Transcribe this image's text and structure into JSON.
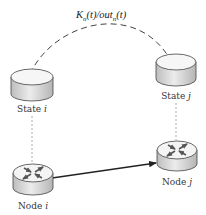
{
  "diagram": {
    "edge_label": {
      "k": "K",
      "k_sub": "n",
      "k_arg": "(t)/",
      "out": "out",
      "out_sub": "n",
      "out_arg": "(t)"
    },
    "nodes": [
      {
        "id": "state_i",
        "kind": "database-cylinder",
        "label_text": "State ",
        "label_var": "i"
      },
      {
        "id": "state_j",
        "kind": "database-cylinder",
        "label_text": "State ",
        "label_var": "j"
      },
      {
        "id": "node_i",
        "kind": "router",
        "label_text": "Node ",
        "label_var": "i"
      },
      {
        "id": "node_j",
        "kind": "router",
        "label_text": "Node ",
        "label_var": "j"
      }
    ],
    "edges": [
      {
        "from": "state_i",
        "to": "state_j",
        "style": "dashed-curve",
        "label": "K_n(t)/out_n(t)"
      },
      {
        "from": "node_i",
        "to": "node_j",
        "style": "solid-arrow"
      },
      {
        "from": "state_i",
        "to": "node_i",
        "style": "dotted-grey"
      },
      {
        "from": "state_j",
        "to": "node_j",
        "style": "dotted-grey"
      }
    ],
    "colors": {
      "stroke": "#333333",
      "cylinder_top": "#f4f4f4",
      "cylinder_side": "#d6d6d6",
      "dotted": "#aaaaaa",
      "router_arrows": "#555555"
    }
  }
}
